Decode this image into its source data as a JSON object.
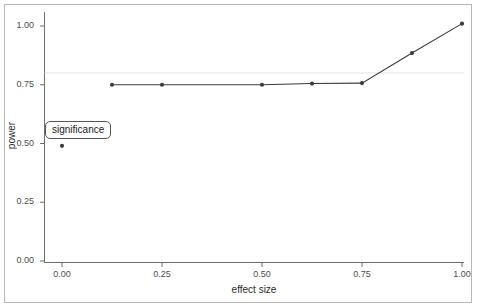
{
  "chart_data": {
    "type": "line",
    "title": "",
    "subtitle": "",
    "xlabel": "effect size",
    "ylabel": "power",
    "xlim": [
      -0.03,
      1.03
    ],
    "ylim": [
      -0.03,
      1.05
    ],
    "xticks": [
      "0.00",
      "0.25",
      "0.50",
      "0.75",
      "1.00"
    ],
    "xtick_values": [
      0.0,
      0.25,
      0.5,
      0.75,
      1.0
    ],
    "yticks": [
      "0.00",
      "0.25",
      "0.50",
      "0.75",
      "1.00"
    ],
    "ytick_values": [
      0.0,
      0.25,
      0.5,
      0.75,
      1.0
    ],
    "grid": false,
    "legend": "none",
    "series": [
      {
        "name": "power curve",
        "x": [
          0.125,
          0.25,
          0.5,
          0.625,
          0.75,
          0.875,
          1.0
        ],
        "values": [
          0.75,
          0.75,
          0.75,
          0.755,
          0.757,
          0.885,
          1.01
        ],
        "color": "#3c3c3c",
        "marker": "circle",
        "connected": true
      },
      {
        "name": "significance point",
        "x": [
          0.0
        ],
        "values": [
          0.49
        ],
        "color": "#3c3c3c",
        "marker": "circle",
        "connected": false
      }
    ],
    "reference_lines": [
      {
        "name": "power-threshold",
        "orientation": "horizontal",
        "value": 0.8,
        "color": "#e4e4e4"
      }
    ],
    "annotations": [
      {
        "name": "significance",
        "text": "significance",
        "x": 0.0,
        "y": 0.56,
        "boxed": true
      }
    ]
  }
}
